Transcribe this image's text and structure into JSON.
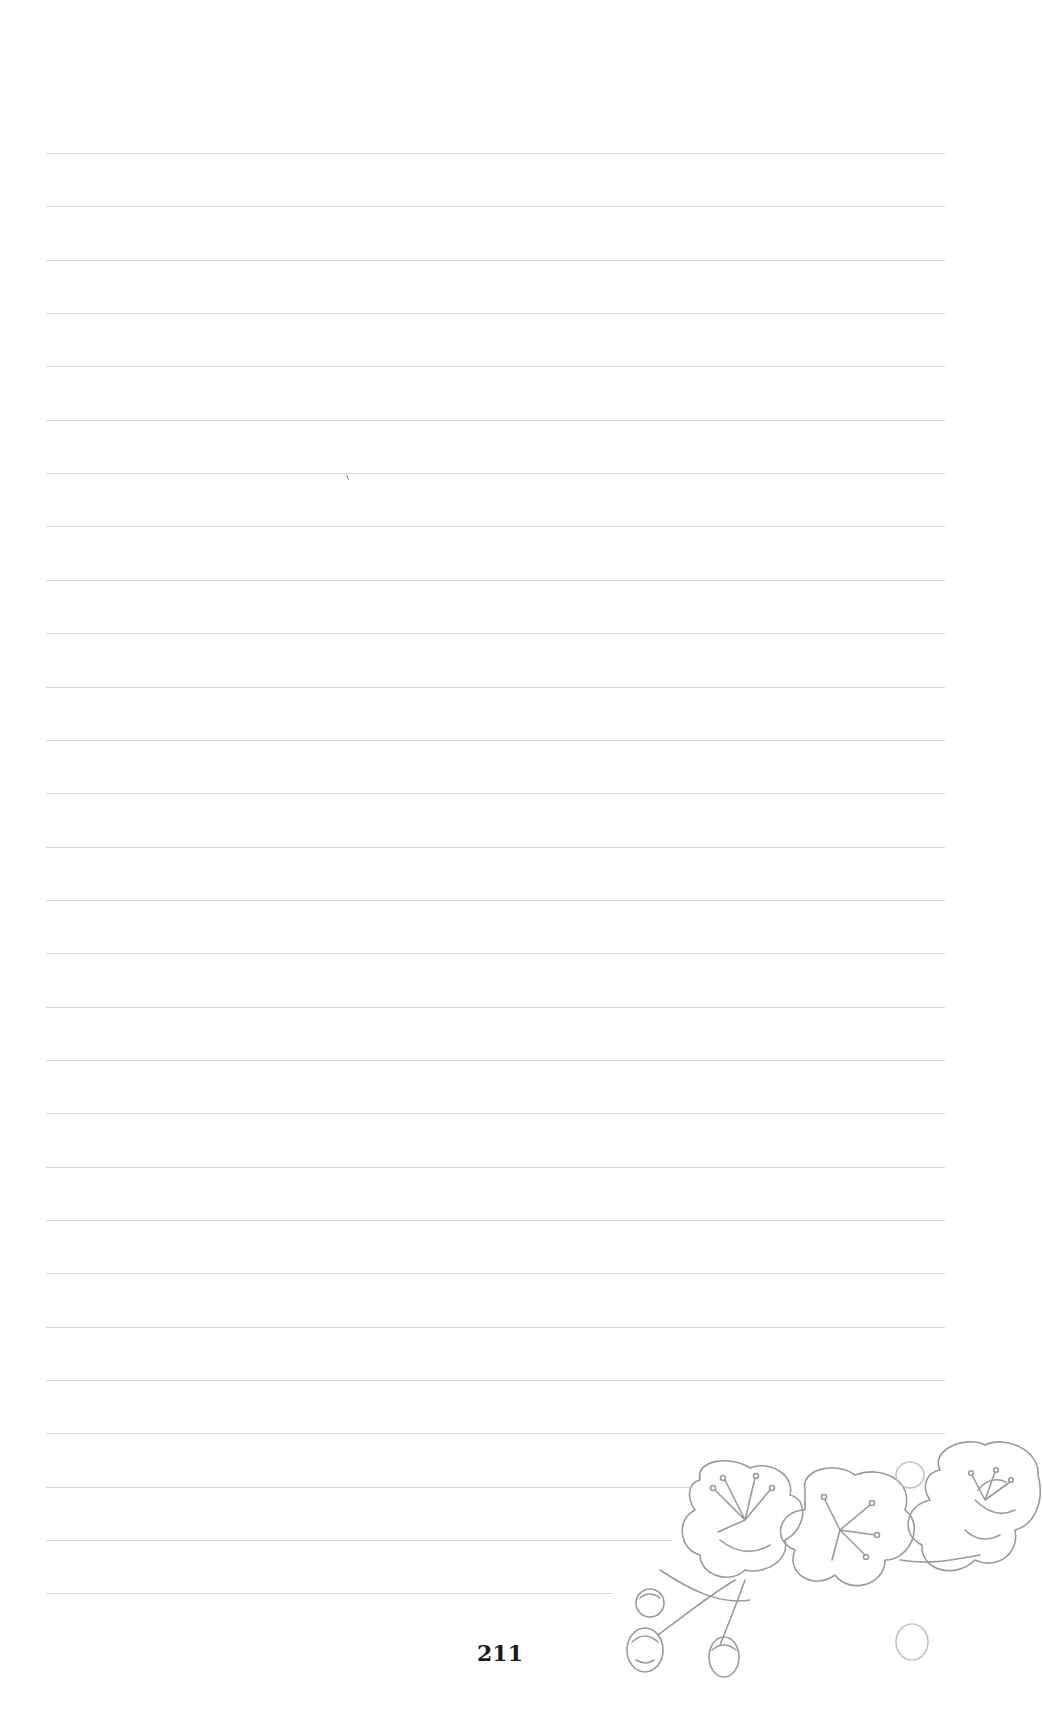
{
  "page": {
    "type": "ruled-notebook-page",
    "background_color": "#ffffff",
    "line_color": "#cfcfcf",
    "page_number": "211",
    "page_number_color": "#1a1a1a"
  },
  "rules": {
    "count": 28,
    "first_y": 153,
    "spacing": 53.35,
    "left_x": 46,
    "default_right_x": 945,
    "shortened": [
      {
        "index": 25,
        "right_x": 690
      },
      {
        "index": 26,
        "right_x": 672
      },
      {
        "index": 27,
        "right_x": 613
      }
    ]
  },
  "decoration": {
    "name": "cherry-blossom-illustration",
    "description": "Gray line-art branch with three open blossoms and four buds",
    "color": "#9a9a9a"
  }
}
